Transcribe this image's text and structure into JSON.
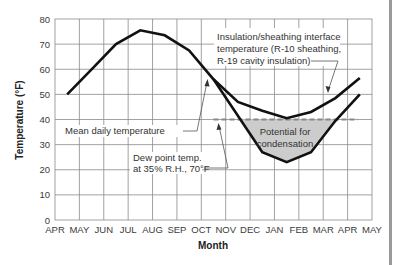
{
  "chart_data": {
    "type": "line",
    "title": "",
    "xlabel": "Month",
    "ylabel": "Temperature (°F)",
    "ylim": [
      0,
      80
    ],
    "yticks": [
      0,
      10,
      20,
      30,
      40,
      50,
      60,
      70,
      80
    ],
    "grid": true,
    "x_tick_labels": [
      "APR",
      "MAY",
      "JUN",
      "JUL",
      "AUG",
      "SEP",
      "OCT",
      "NOV",
      "DEC",
      "JAN",
      "FEB",
      "MAR",
      "APR",
      "MAY"
    ],
    "categories": [
      "APR",
      "MAY",
      "JUN",
      "JUL",
      "AUG",
      "SEP",
      "OCT",
      "NOV",
      "DEC",
      "JAN",
      "FEB",
      "MAR",
      "APR"
    ],
    "series": [
      {
        "name": "Mean daily temperature",
        "style": "solid",
        "values": [
          50,
          60,
          70,
          75.5,
          73.5,
          67.5,
          56,
          41.5,
          27,
          23,
          27,
          39.5,
          50
        ]
      },
      {
        "name": "Insulation/sheathing interface temperature (R-10 sheathing, R-19 cavity insulation)",
        "style": "solid",
        "values": [
          null,
          null,
          null,
          null,
          null,
          null,
          56,
          47,
          43.5,
          40.5,
          43,
          48.5,
          56.5
        ]
      },
      {
        "name": "Dew point temp. at 35% R.H., 70°F",
        "style": "dashed",
        "values": [
          null,
          null,
          null,
          null,
          null,
          null,
          40,
          40,
          40,
          40,
          40,
          40,
          40
        ]
      }
    ],
    "annotations": [
      {
        "text": "Insulation/sheathing interface temperature (R-10 sheathing, R-19 cavity insulation)",
        "target": "interface curve near MAR"
      },
      {
        "text": "Mean daily temperature",
        "target": "mean curve near OCT"
      },
      {
        "text": "Dew point temp. at 35% R.H., 70°F",
        "target": "dashed line at 40°F near NOV"
      },
      {
        "text": "Potential for condensation",
        "target": "shaded region between dew point line and mean temperature curve (NOV–MAR)"
      }
    ],
    "shaded_region": {
      "label": "Potential for condensation",
      "color": "#cccccc",
      "between": [
        "Dew point temp. at 35% R.H., 70°F",
        "Mean daily temperature"
      ]
    }
  },
  "labels": {
    "y_axis": "Temperature (°F)",
    "x_axis": "Month",
    "interface_line1": "Insulation/sheathing interface",
    "interface_line2": "temperature (R-10 sheathing,",
    "interface_line3": "R-19 cavity insulation)",
    "mean_daily": "Mean daily temperature",
    "dew_line1": "Dew point temp.",
    "dew_line2": "at 35% R.H., 70°F",
    "potential_line1": "Potential for",
    "potential_line2": "condensation"
  },
  "colors": {
    "curve": "#111111",
    "grid": "#8a8a8a",
    "shade": "#cccccc",
    "dew_dash": "#888888"
  }
}
